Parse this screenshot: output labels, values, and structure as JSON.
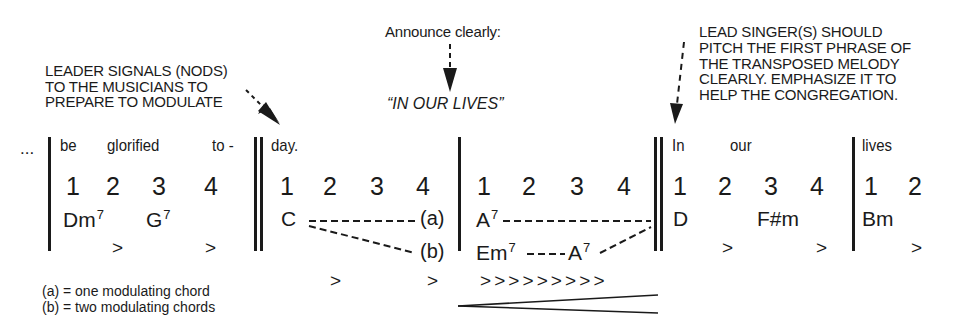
{
  "annotations": {
    "leader": [
      "LEADER SIGNALS (NODS)",
      "TO THE MUSICIANS TO",
      "PREPARE TO MODULATE"
    ],
    "announce_label": "Announce clearly:",
    "announce_text": "“IN OUR LIVES”",
    "lead_singer": [
      "LEAD SINGER(S) SHOULD",
      "PITCH THE FIRST PHRASE OF",
      "THE TRANSPOSED MELODY",
      "CLEARLY. EMPHASIZE IT TO",
      "HELP THE CONGREGATION."
    ]
  },
  "score": {
    "ellipsis": "...",
    "measures": [
      {
        "lyrics": [
          "be",
          "glorified",
          "to -"
        ],
        "beats": [
          "1",
          "2",
          "3",
          "4"
        ],
        "chords": [
          {
            "root": "Dm",
            "ext": "7"
          },
          {
            "root": "G",
            "ext": "7"
          }
        ],
        "accents": [
          ">",
          ">"
        ]
      },
      {
        "lyrics": [
          "day."
        ],
        "beats": [
          "1",
          "2",
          "3",
          "4"
        ],
        "chords": [
          {
            "root": "C",
            "ext": ""
          }
        ],
        "labels": [
          "(a)",
          "(b)"
        ],
        "accents": [
          ">",
          ">"
        ]
      },
      {
        "lyrics": [],
        "beats": [
          "1",
          "2",
          "3",
          "4"
        ],
        "chords_a": [
          {
            "root": "A",
            "ext": "7"
          }
        ],
        "chords_b": [
          {
            "root": "Em",
            "ext": "7"
          },
          {
            "root": "A",
            "ext": "7"
          }
        ],
        "accents": "> > > > > > > > >",
        "dynamics": "crescendo"
      },
      {
        "lyrics": [
          "In",
          "our"
        ],
        "beats": [
          "1",
          "2",
          "3",
          "4"
        ],
        "chords": [
          {
            "root": "D",
            "ext": ""
          },
          {
            "root": "F#m",
            "ext": ""
          }
        ],
        "accents": [
          ">",
          ">"
        ]
      },
      {
        "lyrics": [
          "lives"
        ],
        "beats": [
          "1",
          "2"
        ],
        "chords": [
          {
            "root": "Bm",
            "ext": ""
          }
        ],
        "accents": [
          ">"
        ]
      }
    ]
  },
  "legend": [
    "(a) = one modulating chord",
    "(b) = two modulating chords"
  ]
}
